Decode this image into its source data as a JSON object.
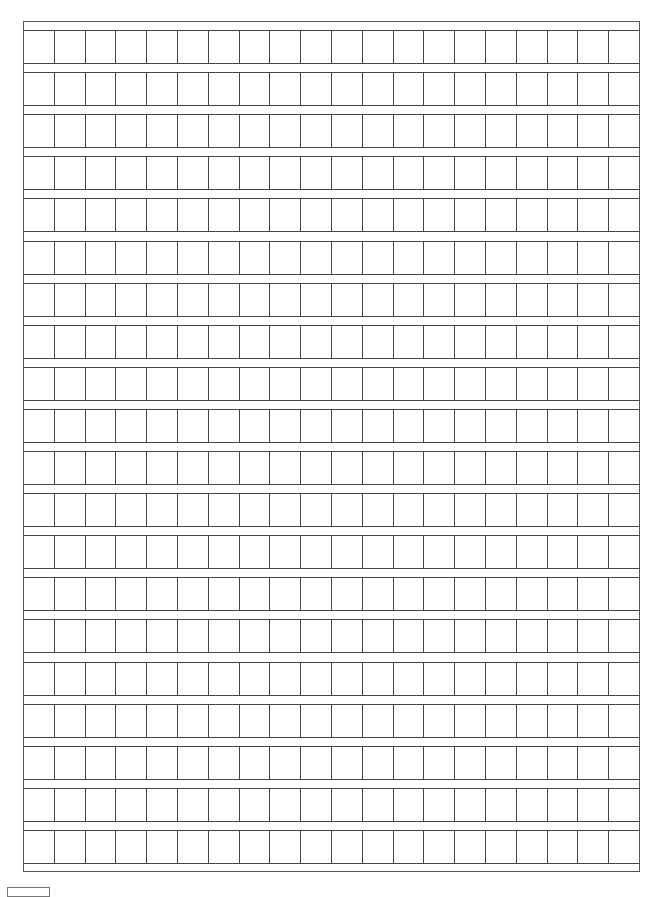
{
  "page": {
    "type": "manuscript grid paper",
    "rows": 20,
    "columns": 20,
    "cells_total": 400,
    "line_color": "#444444",
    "background_color": "#ffffff"
  }
}
